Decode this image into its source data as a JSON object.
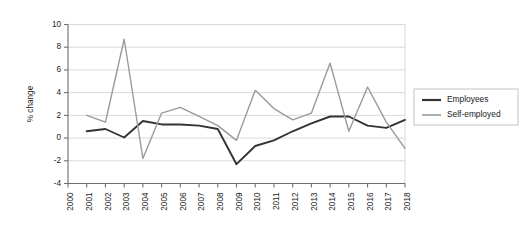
{
  "chart_data": {
    "type": "line",
    "title": "",
    "xlabel": "",
    "ylabel": "% change",
    "ylim": [
      -4,
      10
    ],
    "xlim": [
      2000,
      2018
    ],
    "grid": true,
    "legend_position": "right",
    "categories": [
      2000,
      2001,
      2002,
      2003,
      2004,
      2005,
      2006,
      2007,
      2008,
      2009,
      2010,
      2011,
      2012,
      2013,
      2014,
      2015,
      2016,
      2017,
      2018
    ],
    "xtick_labels": [
      "2000",
      "2001",
      "2002",
      "2003",
      "2004",
      "2005",
      "2006",
      "2007",
      "2008",
      "2009",
      "2010",
      "2011",
      "2012",
      "2013",
      "2014",
      "2015",
      "2016",
      "2017",
      "2018"
    ],
    "ytick_labels": [
      "10",
      "8",
      "6",
      "4",
      "2",
      "0",
      "-2",
      "-4"
    ],
    "ytick_values": [
      10,
      8,
      6,
      4,
      2,
      0,
      -2,
      -4
    ],
    "series": [
      {
        "name": "Employees",
        "color": "#333333",
        "x": [
          2001,
          2002,
          2003,
          2004,
          2005,
          2006,
          2007,
          2008,
          2009,
          2010,
          2011,
          2012,
          2013,
          2014,
          2015,
          2016,
          2017,
          2018
        ],
        "values": [
          0.6,
          0.8,
          0.05,
          1.5,
          1.2,
          1.2,
          1.1,
          0.8,
          -2.3,
          -0.7,
          -0.2,
          0.6,
          1.3,
          1.9,
          1.9,
          1.1,
          0.9,
          1.6
        ]
      },
      {
        "name": "Self-employed",
        "color": "#9a9a9a",
        "x": [
          2001,
          2002,
          2003,
          2004,
          2005,
          2006,
          2007,
          2008,
          2009,
          2010,
          2011,
          2012,
          2013,
          2014,
          2015,
          2016,
          2017,
          2018
        ],
        "values": [
          2.0,
          1.4,
          8.7,
          -1.8,
          2.2,
          2.7,
          1.9,
          1.1,
          -0.2,
          4.2,
          2.6,
          1.6,
          2.2,
          6.6,
          0.6,
          4.5,
          1.4,
          -0.9
        ]
      }
    ]
  },
  "legend": {
    "items": [
      {
        "label": "Employees"
      },
      {
        "label": "Self-employed"
      }
    ]
  }
}
